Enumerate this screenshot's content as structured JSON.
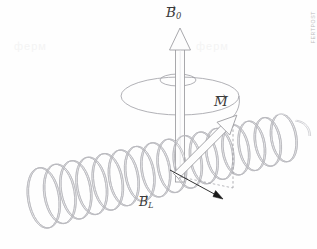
{
  "figure": {
    "type": "vector-diagram",
    "background_color": "#fefefe",
    "width": 317,
    "height": 249
  },
  "labels": {
    "b0": {
      "base": "B",
      "subscript": "0",
      "vector_mark": "→",
      "full": "B⃗0"
    },
    "m": {
      "base": "M",
      "subscript": "",
      "vector_mark": "→",
      "full": "M⃗"
    },
    "bl": {
      "base": "B",
      "subscript": "L",
      "vector_mark": "→",
      "full": "B⃗L"
    }
  },
  "watermarks": {
    "side_text": "FERTPOST",
    "ghost_left": "ферм",
    "ghost_mid": "ферм"
  },
  "colors": {
    "coil_stroke": "#b9b9bd",
    "coil_stroke_light": "#cfcfd4",
    "arrow_outline": "#9a9a9e",
    "arrow_fill": "#fdfdfd",
    "ellipse_stroke": "#9d9da3",
    "black_arrow": "#1b1b1b",
    "label_color": "#3a3a3a",
    "dashed_line": "#8d8d93"
  },
  "elements": {
    "coil": {
      "name": "solenoid-coil",
      "turns": 16,
      "axis_angle_deg": -17,
      "description": "Horizontal helical coil rendered as double-line tubing"
    },
    "b0_arrow": {
      "name": "b0-field-arrow",
      "direction": "up",
      "style": "hollow-3d",
      "from": [
        180,
        178
      ],
      "to": [
        180,
        30
      ]
    },
    "m_arrow": {
      "name": "magnetization-arrow",
      "direction": "up-right",
      "style": "hollow-3d",
      "from": [
        176,
        176
      ],
      "to": [
        233,
        119
      ]
    },
    "bl_arrow": {
      "name": "bl-field-arrow",
      "direction": "down-right",
      "style": "thin-solid",
      "from": [
        172,
        172
      ],
      "to": [
        222,
        198
      ]
    },
    "precession_ellipse": {
      "name": "precession-orbit-ellipse",
      "center": [
        180,
        96
      ],
      "rx": 59,
      "ry": 19
    },
    "precession_arrow_loop": {
      "name": "precession-direction-loop",
      "center": [
        178,
        80
      ],
      "rx": 18,
      "ry": 6
    },
    "projection_line": {
      "name": "magnetization-projection-dashed-line",
      "from": [
        233,
        119
      ],
      "to": [
        233,
        188
      ]
    }
  }
}
